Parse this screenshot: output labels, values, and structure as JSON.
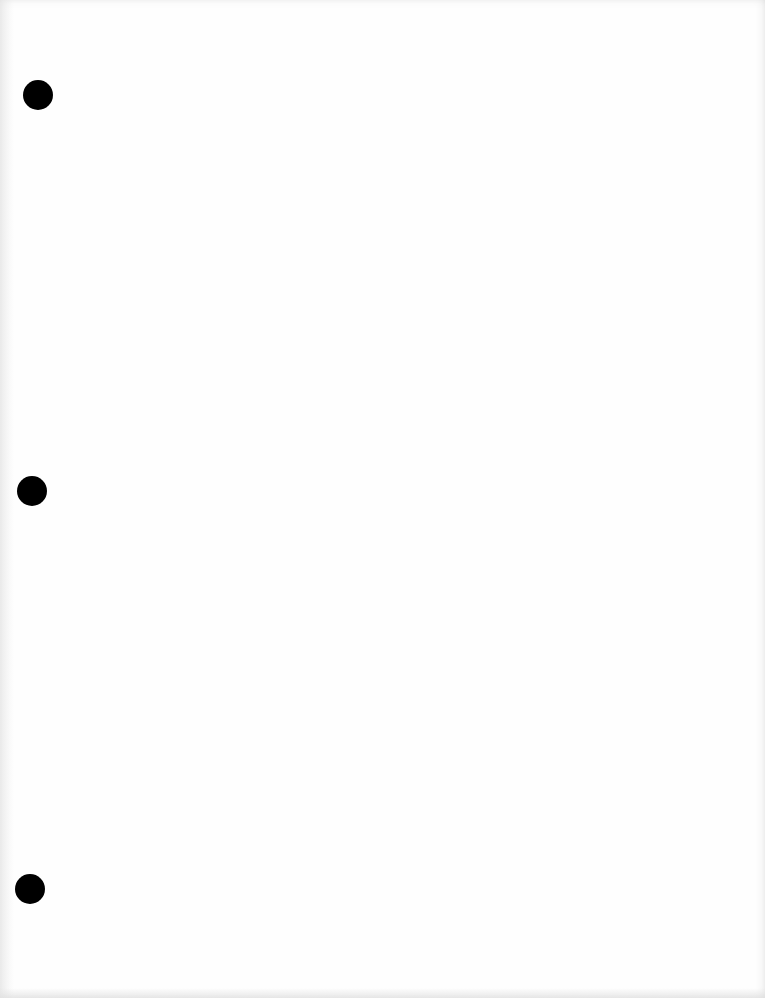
{
  "document": {
    "type": "blank-three-hole-punched-sheet",
    "text": "",
    "background_color": "#fefefe",
    "hole_color": "#000000",
    "holes": [
      {
        "cx": 38,
        "cy": 95,
        "r": 15
      },
      {
        "cx": 32,
        "cy": 491,
        "r": 15
      },
      {
        "cx": 30,
        "cy": 889,
        "r": 15
      }
    ]
  }
}
